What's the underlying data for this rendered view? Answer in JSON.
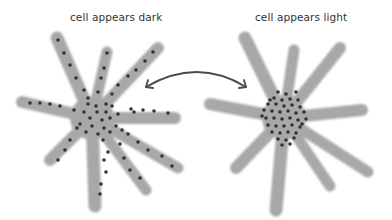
{
  "labels": {
    "left": "cell appears dark",
    "right": "cell appears light"
  },
  "colors": {
    "cell_body": "#a8a8a8",
    "pigment": "#333333",
    "arrow": "#4a4a4a",
    "text": "#333333",
    "background": "#ffffff"
  },
  "cells": [
    {
      "name": "dispersed-cell",
      "state": "dispersed",
      "appearance": "dark"
    },
    {
      "name": "aggregated-cell",
      "state": "aggregated",
      "appearance": "light"
    }
  ],
  "arrow": {
    "type": "double-headed curved",
    "connects": [
      "dispersed-cell",
      "aggregated-cell"
    ]
  }
}
